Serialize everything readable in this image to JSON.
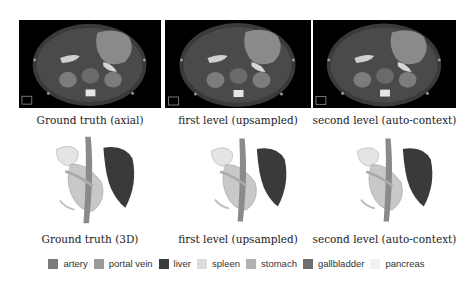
{
  "figure": {
    "rows": [
      {
        "type": "axial",
        "panels": [
          {
            "caption": "Ground truth (axial)"
          },
          {
            "caption": "first level (upsampled)"
          },
          {
            "caption": "second level (auto-context)"
          }
        ]
      },
      {
        "type": "3d",
        "panels": [
          {
            "caption": "Ground truth (3D)"
          },
          {
            "caption": "first level (upsampled)"
          },
          {
            "caption": "second level (auto-context)"
          }
        ]
      }
    ],
    "legend": [
      {
        "label": "artery",
        "color": "#7a7a7a"
      },
      {
        "label": "portal vein",
        "color": "#9a9a9a"
      },
      {
        "label": "liver",
        "color": "#3c3c3c"
      },
      {
        "label": "spleen",
        "color": "#dcdcdc"
      },
      {
        "label": "stomach",
        "color": "#b0b0b0"
      },
      {
        "label": "gallbladder",
        "color": "#6e6e6e"
      },
      {
        "label": "pancreas",
        "color": "#f2f2f2"
      }
    ]
  }
}
